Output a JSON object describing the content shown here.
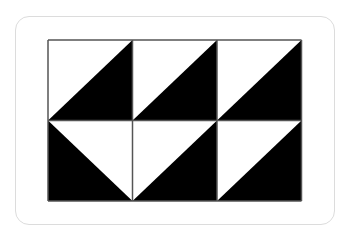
{
  "figure": {
    "type": "triangle-tile-pattern",
    "rows": 2,
    "cols": 3,
    "colors": {
      "fill": "#000000",
      "background": "#ffffff",
      "grid_line": "#555555",
      "card_border": "#dcdcdc"
    },
    "cells": [
      [
        {
          "diagonal": "bl-tr",
          "black": "bottom-right"
        },
        {
          "diagonal": "bl-tr",
          "black": "bottom-right"
        },
        {
          "diagonal": "bl-tr",
          "black": "bottom-right"
        }
      ],
      [
        {
          "diagonal": "tl-br",
          "black": "bottom-left"
        },
        {
          "diagonal": "bl-tr",
          "black": "bottom-right"
        },
        {
          "diagonal": "bl-tr",
          "black": "bottom-right"
        }
      ]
    ]
  }
}
